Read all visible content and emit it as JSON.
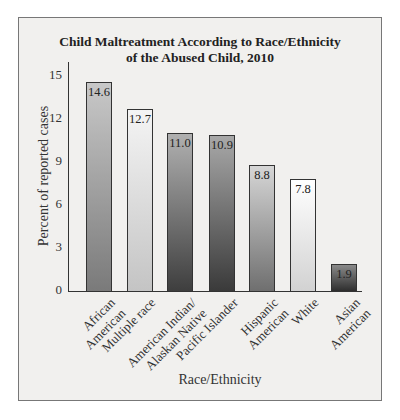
{
  "chart_data": {
    "type": "bar",
    "title": "Child Maltreatment According to Race/Ethnicity of the Abused Child, 2010",
    "title_lines": [
      "Child Maltreatment According to Race/Ethnicity",
      "of the Abused Child, 2010"
    ],
    "xlabel": "Race/Ethnicity",
    "ylabel": "Percent of reported cases",
    "ylim": [
      0,
      15
    ],
    "yticks": [
      "0",
      "3",
      "6",
      "9",
      "12",
      "15"
    ],
    "grid": false,
    "legend": null,
    "categories": [
      "African American",
      "Multiple race",
      "American Indian/ Alaskan Native",
      "Pacific Islander",
      "Hispanic American",
      "White",
      "Asian American"
    ],
    "category_lines": [
      [
        "African",
        "American"
      ],
      [
        "Multiple race"
      ],
      [
        "American Indian/",
        "Alaskan Native"
      ],
      [
        "Pacific Islander"
      ],
      [
        "Hispanic",
        "American"
      ],
      [
        "White"
      ],
      [
        "Asian",
        "American"
      ]
    ],
    "values": [
      14.6,
      12.7,
      11.0,
      10.9,
      8.8,
      7.8,
      1.9
    ],
    "value_labels": [
      "14.6",
      "12.7",
      "11.0",
      "10.9",
      "8.8",
      "7.8",
      "1.9"
    ],
    "bar_styles": [
      {
        "top": "#c8c8c8",
        "bottom": "#7a7a7a"
      },
      {
        "top": "#f4f4f4",
        "bottom": "#c4c4c4"
      },
      {
        "top": "#b0b0b0",
        "bottom": "#3e3e3e"
      },
      {
        "top": "#a8a8a8",
        "bottom": "#3a3a3a"
      },
      {
        "top": "#d6d6d6",
        "bottom": "#6f6f6f"
      },
      {
        "top": "#ffffff",
        "bottom": "#d2d2d2"
      },
      {
        "top": "#8a8a8a",
        "bottom": "#2e2e2e"
      }
    ]
  },
  "colors": {
    "frame_bg": "#f1f0ee",
    "frame_border": "#777777",
    "axis": "#333333"
  }
}
